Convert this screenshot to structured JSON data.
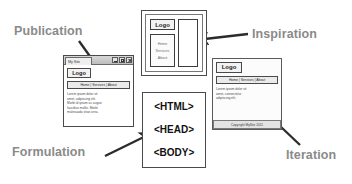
{
  "diagram": {
    "label_color": "#8a8a8a"
  },
  "annotations": [
    {
      "id": "publication",
      "label": "Publication"
    },
    {
      "id": "inspiration",
      "label": "Inspiration"
    },
    {
      "id": "formulation",
      "label": "Formulation"
    },
    {
      "id": "iteration",
      "label": "Iteration"
    }
  ],
  "publication": {
    "window_title": "My Site",
    "controls": [
      {
        "name": "minimize",
        "glyph": "minimize-icon"
      },
      {
        "name": "maximize",
        "glyph": "maximize-icon"
      },
      {
        "name": "close",
        "glyph": "close-icon"
      }
    ],
    "logo": "Logo",
    "nav": "Home | Services | About",
    "body_lines": [
      "Lorem ipsum dolor sit",
      "amet, adipiscing elit.",
      "Morbi id ipsum ac augue",
      "faucibus mollis. Morbi",
      "malesuada vitae urna."
    ]
  },
  "inspiration": {
    "logo": "Logo",
    "nav_items": [
      "Home",
      "Services",
      "About"
    ],
    "content_label": ""
  },
  "formulation": {
    "lines": [
      "<HTML>",
      "<HEAD>",
      "<BODY>"
    ]
  },
  "iteration": {
    "logo": "Logo",
    "nav": "Home | Services | About",
    "body_lines": [
      "Lorem ipsum dolor sit",
      "amet, consectetur",
      "adipiscing elit."
    ],
    "footer": "Copyright MySite 2011"
  }
}
